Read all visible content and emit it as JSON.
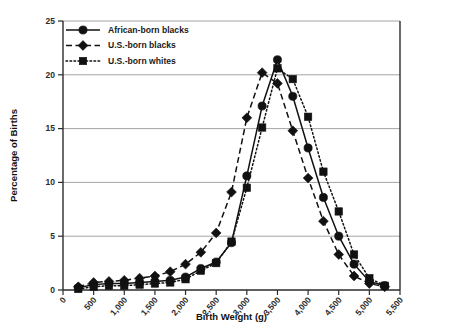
{
  "chart_data": {
    "type": "line",
    "title": "",
    "xlabel": "Birth Weight (g)",
    "ylabel": "Percentage of Births",
    "xlim": [
      0,
      5500
    ],
    "ylim": [
      0,
      25
    ],
    "xticks": [
      0,
      500,
      1000,
      1500,
      2000,
      2500,
      3000,
      3500,
      4000,
      4500,
      5000,
      5500
    ],
    "xtick_labels": [
      "0",
      "500",
      "1,000",
      "1,500",
      "2,000",
      "2,500",
      "3,000",
      "3,500",
      "4,000",
      "4,500",
      "5,000",
      "5,500"
    ],
    "yticks": [
      0,
      5,
      10,
      15,
      20,
      25
    ],
    "ytick_labels": [
      "0",
      "5",
      "10",
      "15",
      "20",
      "25"
    ],
    "grid": "horizontal",
    "legend_position": "top-left",
    "x": [
      250,
      500,
      750,
      1000,
      1250,
      1500,
      1750,
      2000,
      2250,
      2500,
      2750,
      3000,
      3250,
      3500,
      3750,
      4000,
      4250,
      4500,
      4750,
      5000,
      5250
    ],
    "series": [
      {
        "name": "African-born blacks",
        "marker": "circle",
        "linestyle": "solid",
        "color": "#111111",
        "values": [
          0.2,
          0.5,
          0.6,
          0.6,
          0.7,
          0.8,
          0.9,
          1.2,
          2.0,
          2.6,
          4.4,
          10.6,
          17.1,
          21.4,
          18.0,
          13.2,
          8.6,
          5.0,
          2.4,
          0.8,
          0.4
        ]
      },
      {
        "name": "U.S.-born blacks",
        "marker": "diamond",
        "linestyle": "dashed",
        "color": "#111111",
        "values": [
          0.3,
          0.7,
          0.8,
          0.9,
          1.1,
          1.3,
          1.7,
          2.4,
          3.5,
          5.3,
          9.1,
          16.0,
          20.2,
          19.2,
          14.8,
          10.4,
          6.4,
          3.3,
          1.3,
          0.6,
          0.3
        ]
      },
      {
        "name": "U.S.-born whites",
        "marker": "square",
        "linestyle": "dotted",
        "color": "#111111",
        "values": [
          0.1,
          0.3,
          0.4,
          0.4,
          0.5,
          0.6,
          0.7,
          1.0,
          1.8,
          2.5,
          4.5,
          9.5,
          15.1,
          20.6,
          19.6,
          16.1,
          11.0,
          7.3,
          3.3,
          1.1,
          0.4
        ]
      }
    ]
  },
  "legend": {
    "items": [
      {
        "label": "African-born blacks"
      },
      {
        "label": "U.S.-born blacks"
      },
      {
        "label": "U.S.-born whites"
      }
    ]
  }
}
